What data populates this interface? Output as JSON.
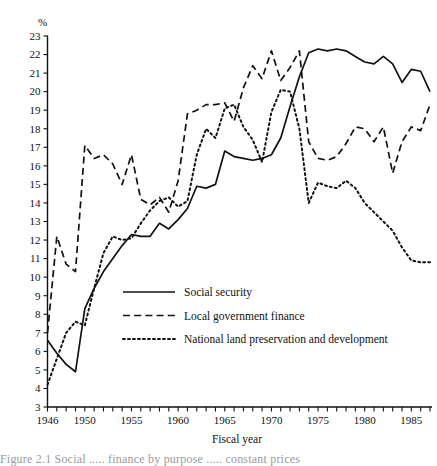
{
  "chart_data": {
    "type": "line",
    "title": "",
    "xlabel": "Fiscal year",
    "ylabel": "%",
    "yunit_label": "%",
    "xlim": [
      1946,
      1987
    ],
    "ylim": [
      3,
      23
    ],
    "ytick_step": 1,
    "xtick_step": 1,
    "xtick_labeled_step": 5,
    "grid": false,
    "legend_position": "center-left-inside",
    "yticks": [
      3,
      4,
      5,
      6,
      7,
      8,
      9,
      10,
      11,
      12,
      13,
      14,
      15,
      16,
      17,
      18,
      19,
      20,
      21,
      22,
      23
    ],
    "ytick_labels": [
      "3",
      "4",
      "5",
      "6",
      "7",
      "8",
      "9",
      "10",
      "11",
      "12",
      "13",
      "14",
      "15",
      "16",
      "17",
      "18",
      "19",
      "20",
      "21",
      "22",
      "23"
    ],
    "xticks": [
      1946,
      1947,
      1948,
      1949,
      1950,
      1951,
      1952,
      1953,
      1954,
      1955,
      1956,
      1957,
      1958,
      1959,
      1960,
      1961,
      1962,
      1963,
      1964,
      1965,
      1966,
      1967,
      1968,
      1969,
      1970,
      1971,
      1972,
      1973,
      1974,
      1975,
      1976,
      1977,
      1978,
      1979,
      1980,
      1981,
      1982,
      1983,
      1984,
      1985,
      1986,
      1987
    ],
    "xtick_labels_shown": [
      "1946",
      "1950",
      "1955",
      "1960",
      "1965",
      "1970",
      "1975",
      "1980",
      "1985"
    ],
    "x": [
      1946,
      1947,
      1948,
      1949,
      1950,
      1951,
      1952,
      1953,
      1954,
      1955,
      1956,
      1957,
      1958,
      1959,
      1960,
      1961,
      1962,
      1963,
      1964,
      1965,
      1966,
      1967,
      1968,
      1969,
      1970,
      1971,
      1972,
      1973,
      1974,
      1975,
      1976,
      1977,
      1978,
      1979,
      1980,
      1981,
      1982,
      1983,
      1984,
      1985,
      1986,
      1987
    ],
    "series": [
      {
        "name": "Social security",
        "style": "solid",
        "values": [
          6.6,
          5.9,
          5.3,
          4.9,
          8.3,
          9.4,
          10.3,
          11.0,
          11.7,
          12.3,
          12.2,
          12.2,
          12.9,
          12.6,
          13.1,
          13.7,
          14.9,
          14.8,
          15.0,
          16.8,
          16.5,
          16.4,
          16.3,
          16.4,
          16.6,
          17.5,
          19.2,
          20.8,
          22.1,
          22.3,
          22.2,
          22.3,
          22.2,
          21.9,
          21.6,
          21.5,
          21.9,
          21.5,
          20.5,
          21.2,
          21.1,
          20.0
        ]
      },
      {
        "name": "Local government finance",
        "style": "dashed",
        "values": [
          7.0,
          12.2,
          10.7,
          10.3,
          17.1,
          16.4,
          16.6,
          16.1,
          15.0,
          16.6,
          14.2,
          13.9,
          14.3,
          13.5,
          15.2,
          18.8,
          19.0,
          19.3,
          19.3,
          19.4,
          18.4,
          20.2,
          21.4,
          20.7,
          22.2,
          20.6,
          21.3,
          22.2,
          17.3,
          16.4,
          16.3,
          16.5,
          17.2,
          18.1,
          18.0,
          17.3,
          18.1,
          15.6,
          17.3,
          18.1,
          17.9,
          19.3
        ]
      },
      {
        "name": "National land preservation and development",
        "style": "dotted",
        "values": [
          4.2,
          5.6,
          7.0,
          7.6,
          7.4,
          9.4,
          11.3,
          12.2,
          12.0,
          12.1,
          12.9,
          13.6,
          14.1,
          14.3,
          13.8,
          14.1,
          16.6,
          18.0,
          17.5,
          19.1,
          19.3,
          18.1,
          17.4,
          16.2,
          18.9,
          20.1,
          20.0,
          18.0,
          14.0,
          15.1,
          14.9,
          14.8,
          15.2,
          14.8,
          14.0,
          13.5,
          13.0,
          12.5,
          11.6,
          10.9,
          10.8,
          10.8
        ]
      }
    ]
  },
  "legend": {
    "entries": [
      {
        "label": "Social security",
        "style": "solid"
      },
      {
        "label": "Local government finance",
        "style": "dashed"
      },
      {
        "label": "National land preservation and development",
        "style": "dotted"
      }
    ]
  },
  "caption_fragment": "Figure 2.1  Social ..... finance by purpose ..... constant prices"
}
